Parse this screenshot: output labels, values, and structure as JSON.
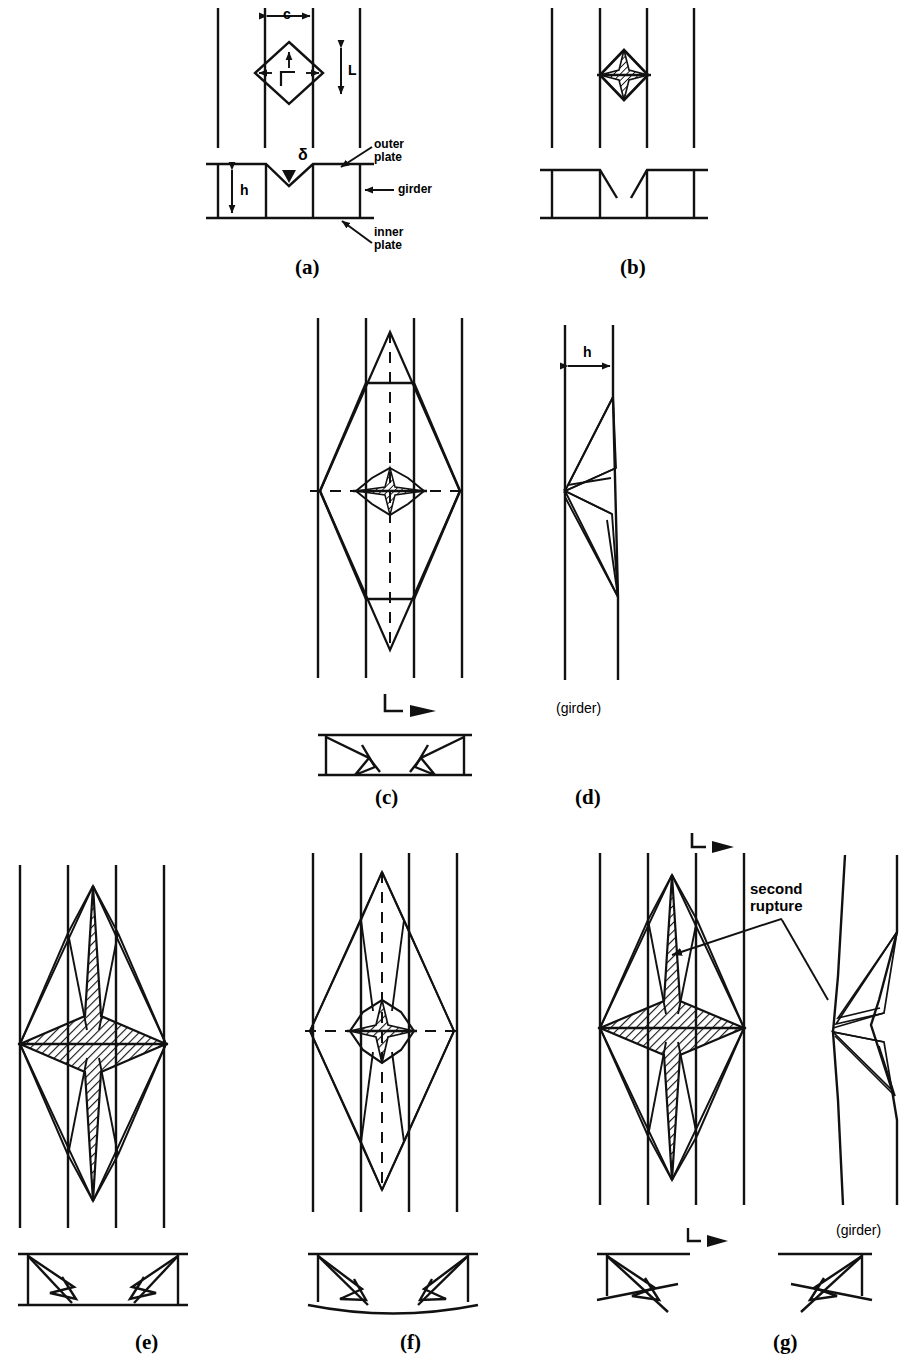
{
  "figure": {
    "width": 904,
    "height": 1363,
    "stroke_color": "#111111",
    "background": "#ffffff",
    "hatch_color": "#111111"
  },
  "panels": [
    {
      "id": "a",
      "label": "(a)",
      "x": 295,
      "y": 255,
      "caption": "initial indentation, plan view with diamond fold and section with dent depth"
    },
    {
      "id": "b",
      "label": "(b)",
      "x": 620,
      "y": 255,
      "caption": "first rupture, star-shaped tear at dent centre"
    },
    {
      "id": "c",
      "label": "(c)",
      "x": 375,
      "y": 785,
      "caption": "tear propagation forming large rhombic fold field"
    },
    {
      "id": "d",
      "label": "(d)",
      "x": 575,
      "y": 785,
      "caption": "girder side elevation showing folding over height h"
    },
    {
      "id": "e",
      "label": "(e)",
      "x": 135,
      "y": 1330,
      "caption": "fully developed four-pointed star rupture"
    },
    {
      "id": "f",
      "label": "(f)",
      "x": 400,
      "y": 1330,
      "caption": "rhombic fold field with small central star"
    },
    {
      "id": "g",
      "label": "(g)",
      "x": 773,
      "y": 1330,
      "caption": "second rupture stage with girder deformation"
    }
  ],
  "annotations": {
    "dim_c": "c",
    "dim_L": "L",
    "dim_h_a": "h",
    "dim_h_d": "h",
    "delta": "δ",
    "outer_plate": "outer\nplate",
    "girder": "girder",
    "inner_plate": "inner\nplate",
    "girder_d": "(girder)",
    "girder_g": "(girder)",
    "second_rupture": "second\nrupture"
  },
  "icons": {
    "section_cut_marker": "section-cut-arrow-icon",
    "dimension_arrow": "double-headed-arrow-icon",
    "leader_arrow": "leader-arrow-icon"
  }
}
